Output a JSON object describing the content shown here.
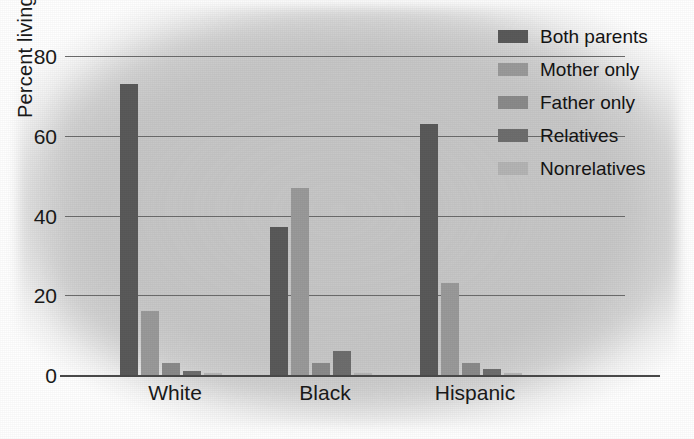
{
  "chart_data": {
    "type": "bar",
    "title": "",
    "xlabel": "",
    "ylabel": "Percent living with",
    "categories": [
      "White",
      "Black",
      "Hispanic"
    ],
    "ylim": [
      0,
      80
    ],
    "yticks": [
      "0",
      "20",
      "40",
      "60",
      "80"
    ],
    "ytick_values": [
      0,
      20,
      40,
      60,
      80
    ],
    "grid": true,
    "legend_position": "top-right",
    "series": [
      {
        "name": "Both parents",
        "color": "#5a5a5a",
        "values": [
          73,
          37,
          63
        ]
      },
      {
        "name": "Mother only",
        "color": "#9a9a9a",
        "values": [
          16,
          47,
          23
        ]
      },
      {
        "name": "Father only",
        "color": "#8a8a8a",
        "values": [
          3,
          3,
          3
        ]
      },
      {
        "name": "Relatives",
        "color": "#6e6e6e",
        "values": [
          1,
          6,
          1.5
        ]
      },
      {
        "name": "Nonrelatives",
        "color": "#b4b4b4",
        "values": [
          0.5,
          0.6,
          0.4
        ]
      }
    ]
  },
  "colors": {
    "background": "#ffffff",
    "plot_background": "#c9c9c9",
    "gridline": "#6b6b6b",
    "axis": "#4a4a4a",
    "text": "#1a1a1a"
  }
}
